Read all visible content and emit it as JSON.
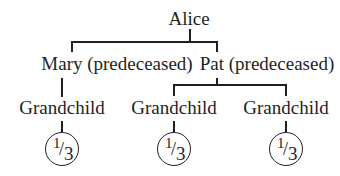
{
  "diagram": {
    "type": "family-tree",
    "root": {
      "label": "Alice"
    },
    "children": [
      {
        "label": "Mary (predeceased)"
      },
      {
        "label": "Pat (predeceased)"
      }
    ],
    "grandchildren": [
      {
        "label": "Grandchild",
        "parent": "Mary (predeceased)",
        "share": {
          "numerator": "1",
          "slash": "/",
          "denominator": "3"
        }
      },
      {
        "label": "Grandchild",
        "parent": "Pat (predeceased)",
        "share": {
          "numerator": "1",
          "slash": "/",
          "denominator": "3"
        }
      },
      {
        "label": "Grandchild",
        "parent": "Pat (predeceased)",
        "share": {
          "numerator": "1",
          "slash": "/",
          "denominator": "3"
        }
      }
    ],
    "colors": {
      "ink": "#231f20",
      "background": "#ffffff"
    }
  }
}
